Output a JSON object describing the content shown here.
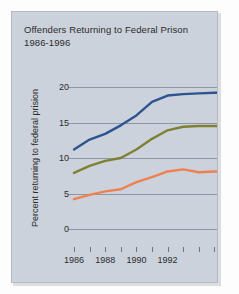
{
  "chart_data": {
    "type": "line",
    "title": "Offenders Returning to Federal Prison",
    "subtitle": "1986-1996",
    "xlabel": "",
    "ylabel": "Percent returning to federal prision",
    "xlim": [
      1986,
      1996
    ],
    "ylim": [
      0,
      20
    ],
    "yticks": [
      0,
      5,
      10,
      15,
      20
    ],
    "ytick_labels": [
      "0",
      "5",
      "10",
      "15",
      "20"
    ],
    "xticks": [
      1986,
      1987,
      1988,
      1989,
      1990,
      1991,
      1992,
      1993,
      1994,
      1995,
      1996
    ],
    "xtick_labels": [
      "1986",
      "",
      "1988",
      "",
      "1990",
      "",
      "1992",
      "",
      "",
      "",
      ""
    ],
    "grid": true,
    "legend": "none",
    "x": [
      1986,
      1987,
      1988,
      1989,
      1990,
      1991,
      1992,
      1993,
      1994,
      1995,
      1996
    ],
    "series": [
      {
        "name": "series-blue",
        "color": "#2d5390",
        "values": [
          11.2,
          12.6,
          13.4,
          14.6,
          16.0,
          17.9,
          18.8,
          19.0,
          19.1,
          19.2,
          19.2
        ]
      },
      {
        "name": "series-olive",
        "color": "#808035",
        "values": [
          7.9,
          8.9,
          9.6,
          10.0,
          11.2,
          12.7,
          13.9,
          14.4,
          14.5,
          14.5,
          14.5
        ]
      },
      {
        "name": "series-orange",
        "color": "#ef8050",
        "values": [
          4.2,
          4.8,
          5.3,
          5.6,
          6.6,
          7.3,
          8.1,
          8.4,
          8.0,
          8.1,
          8.1
        ]
      }
    ]
  },
  "colors": {
    "panel_background": "#ccd2dc",
    "gridline": "#8f96a3",
    "text": "#2b2b2b",
    "series_blue": "#2d5390",
    "series_olive": "#808035",
    "series_orange": "#ef8050"
  }
}
